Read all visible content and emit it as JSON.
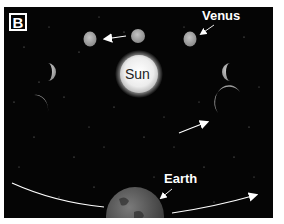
{
  "panel": {
    "badge": "B"
  },
  "labels": {
    "venus": "Venus",
    "sun": "Sun",
    "earth": "Earth"
  },
  "colors": {
    "background": "#050505",
    "venus": "#a8a8a8",
    "sun": "#f2f2f2",
    "earth": "#5a5a5a",
    "arrow": "#ffffff"
  }
}
